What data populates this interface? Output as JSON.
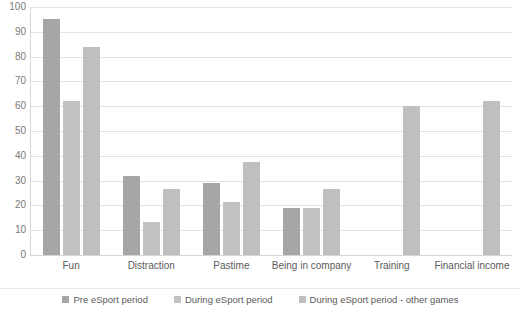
{
  "chart_data": {
    "type": "bar",
    "title": "",
    "subtitle": "",
    "xlabel": "",
    "ylabel": "",
    "ylim": [
      0,
      100
    ],
    "ytick_step": 10,
    "yticks": [
      100,
      90,
      80,
      70,
      60,
      50,
      40,
      30,
      20,
      10,
      0
    ],
    "grid": true,
    "legend_position": "bottom",
    "categories": [
      "Fun",
      "Distraction",
      "Pastime",
      "Being in company",
      "Training",
      "Financial income"
    ],
    "series": [
      {
        "name": "Pre eSport period",
        "color": "#a6a6a6",
        "values": [
          95,
          32,
          29,
          19,
          null,
          null
        ]
      },
      {
        "name": "During eSport period",
        "color": "#c2c2c2",
        "values": [
          62,
          13.5,
          21.5,
          19,
          null,
          null
        ]
      },
      {
        "name": "During eSport period - other games",
        "color": "#bfbfbf",
        "values": [
          84,
          26.5,
          37.5,
          26.5,
          60,
          62
        ]
      }
    ]
  },
  "colors": {
    "background": "#ffffff",
    "gridline": "#e3e3e3",
    "axis": "#d6d6d6",
    "tick_text": "#7a7a7a",
    "label_text": "#5a5a5a"
  }
}
